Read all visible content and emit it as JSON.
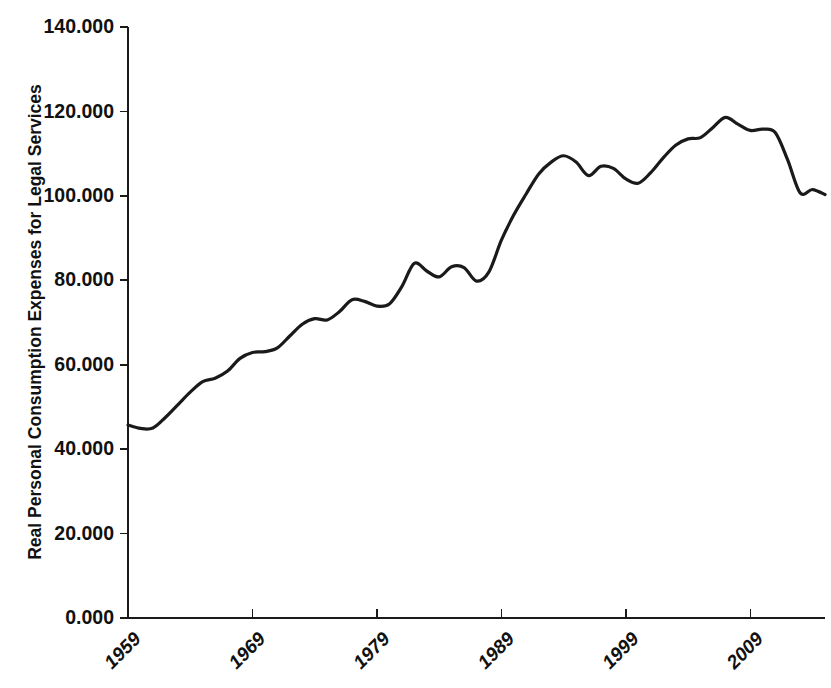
{
  "chart_data": {
    "type": "line",
    "title": "",
    "xlabel": "",
    "ylabel": "Real Personal Consumption Expenses for Legal Services",
    "ylim": [
      0,
      140
    ],
    "xlim": [
      1959,
      2015
    ],
    "grid": false,
    "legend": "none",
    "line_color": "#1a1a1a",
    "line_width": 3.2,
    "y_ticks": [
      "0.000",
      "20.000",
      "40.000",
      "60.000",
      "80.000",
      "100.000",
      "120.000",
      "140.000"
    ],
    "y_tick_values": [
      0,
      20,
      40,
      60,
      80,
      100,
      120,
      140
    ],
    "x_ticks": [
      "1959",
      "1969",
      "1979",
      "1989",
      "1999",
      "2009"
    ],
    "x_tick_values": [
      1959,
      1969,
      1979,
      1989,
      1999,
      2009
    ],
    "x_tick_rotation": 45,
    "series": [
      {
        "name": "Real Personal Consumption Expenses for Legal Services",
        "x": [
          1959,
          1960,
          1961,
          1962,
          1963,
          1964,
          1965,
          1966,
          1967,
          1968,
          1969,
          1970,
          1971,
          1972,
          1973,
          1974,
          1975,
          1976,
          1977,
          1978,
          1979,
          1980,
          1981,
          1982,
          1983,
          1984,
          1985,
          1986,
          1987,
          1988,
          1989,
          1990,
          1991,
          1992,
          1993,
          1994,
          1995,
          1996,
          1997,
          1998,
          1999,
          2000,
          2001,
          2002,
          2003,
          2004,
          2005,
          2006,
          2007,
          2008,
          2009,
          2010,
          2011,
          2012,
          2013,
          2014,
          2015
        ],
        "values": [
          45.7,
          44.9,
          45.0,
          47.5,
          50.5,
          53.5,
          56.0,
          56.8,
          58.5,
          61.5,
          62.9,
          63.1,
          64.0,
          66.8,
          69.6,
          70.9,
          70.6,
          72.6,
          75.4,
          75.0,
          73.9,
          74.4,
          78.5,
          84.0,
          82.2,
          80.8,
          83.2,
          83.0,
          79.8,
          82.0,
          89.5,
          95.5,
          100.5,
          105.2,
          108.0,
          109.5,
          108.0,
          104.8,
          107.0,
          106.5,
          104.0,
          103.0,
          105.5,
          109.0,
          112.0,
          113.5,
          113.8,
          116.2,
          118.6,
          117.0,
          115.5,
          115.8,
          115.0,
          108.5,
          100.7,
          101.5,
          100.3
        ]
      }
    ],
    "annotations": [
      {
        "label": "series minimum",
        "x": 1960,
        "y": 44.9
      },
      {
        "label": "series maximum",
        "x": 2007,
        "y": 118.6
      }
    ]
  },
  "axes": {
    "y_axis_title": "Real Personal Consumption Expenses for Legal Services",
    "plot_left_px": 128,
    "plot_right_px": 825,
    "plot_top_px": 27,
    "plot_bottom_px": 618
  }
}
